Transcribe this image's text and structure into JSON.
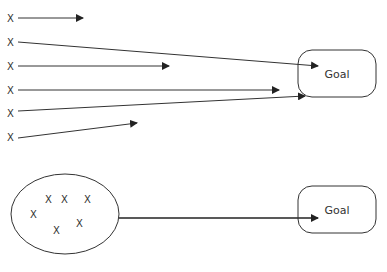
{
  "top": {
    "marks": [
      "X",
      "X",
      "X",
      "X",
      "X",
      "X"
    ],
    "goal": "Goal"
  },
  "bottom": {
    "marks": [
      "X",
      "X",
      "X",
      "X",
      "X",
      "X"
    ],
    "goal": "Goal"
  },
  "colors": {
    "stroke": "#333333",
    "background": "#ffffff"
  }
}
